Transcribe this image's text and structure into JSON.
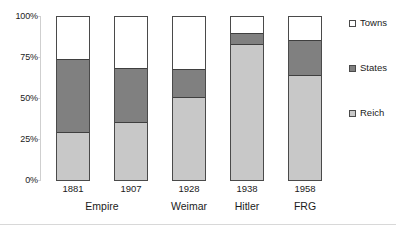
{
  "chart_data": {
    "type": "bar",
    "subtype": "stacked-100-percent",
    "title": "",
    "subtitle": "",
    "xlabel": "",
    "ylabel": "",
    "categories": [
      "1881",
      "1907",
      "1928",
      "1938",
      "1958"
    ],
    "category_groups": [
      {
        "label": "Empire",
        "categories": [
          "1881",
          "1907"
        ]
      },
      {
        "label": "Weimar",
        "categories": [
          "1928"
        ]
      },
      {
        "label": "Hitler",
        "categories": [
          "1938"
        ]
      },
      {
        "label": "FRG",
        "categories": [
          "1958"
        ]
      }
    ],
    "series": [
      {
        "name": "Towns",
        "color": "#ffffff",
        "values": [
          26,
          31,
          32,
          10,
          14
        ]
      },
      {
        "name": "States",
        "color": "#808080",
        "values": [
          45,
          34,
          18,
          7,
          22
        ]
      },
      {
        "name": "Reich",
        "color": "#c8c8c8",
        "values": [
          29,
          35,
          50,
          83,
          64
        ]
      }
    ],
    "stack_order_top_to_bottom": [
      "Towns",
      "States",
      "Reich"
    ],
    "ylim": [
      0,
      100
    ],
    "yticks": [
      0,
      25,
      50,
      75,
      100
    ],
    "ytick_labels": [
      "0%",
      "25%",
      "50%",
      "75%",
      "100%"
    ],
    "grid": false,
    "legend_position": "right",
    "legend_entries": [
      "Towns",
      "States",
      "Reich"
    ]
  },
  "axis": {
    "y_ticks": [
      {
        "label": "100%",
        "value": 100
      },
      {
        "label": "75%",
        "value": 75
      },
      {
        "label": "50%",
        "value": 50
      },
      {
        "label": "25%",
        "value": 25
      },
      {
        "label": "0%",
        "value": 0
      }
    ],
    "x_years": [
      "1881",
      "1907",
      "1928",
      "1938",
      "1958"
    ],
    "x_eras": [
      "Empire",
      "Weimar",
      "Hitler",
      "FRG"
    ]
  },
  "legend": {
    "items": [
      {
        "label": "Towns",
        "color": "#ffffff"
      },
      {
        "label": "States",
        "color": "#808080"
      },
      {
        "label": "Reich",
        "color": "#c8c8c8"
      }
    ]
  },
  "colors": {
    "towns": "#ffffff",
    "states": "#808080",
    "reich": "#c8c8c8",
    "bar_outline": "#4a4a4a",
    "axis_line": "#cfcfcf",
    "text": "#1b1b1b"
  }
}
